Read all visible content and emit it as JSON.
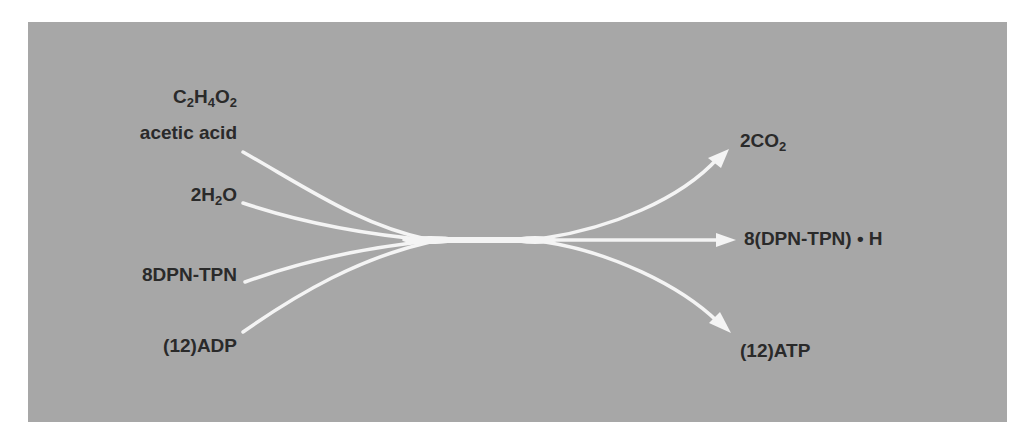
{
  "diagram": {
    "type": "reaction-flow",
    "background_color": "#a7a7a7",
    "arrow_color": "#f4f4f4",
    "text_color": "#2a2a2a",
    "inputs": [
      {
        "id": "acetic-acid",
        "formula_parts": [
          {
            "t": "C"
          },
          {
            "s": "2"
          },
          {
            "t": "H"
          },
          {
            "s": "4"
          },
          {
            "t": "O"
          },
          {
            "s": "2"
          }
        ],
        "formula": "C2H4O2",
        "name": "acetic acid"
      },
      {
        "id": "water",
        "formula_parts": [
          {
            "t": "2H"
          },
          {
            "s": "2"
          },
          {
            "t": "O"
          }
        ],
        "formula": "2H2O"
      },
      {
        "id": "dpn-tpn",
        "label": "8DPN-TPN"
      },
      {
        "id": "adp",
        "label": "(12)ADP"
      }
    ],
    "outputs": [
      {
        "id": "co2",
        "formula_parts": [
          {
            "t": "2CO"
          },
          {
            "s": "2"
          }
        ],
        "formula": "2CO2"
      },
      {
        "id": "dpn-tpn-h",
        "label": "8(DPN-TPN) • H"
      },
      {
        "id": "atp",
        "label": "(12)ATP"
      }
    ]
  }
}
